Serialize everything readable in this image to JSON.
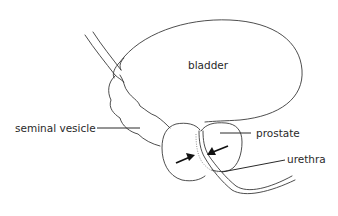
{
  "diagram": {
    "type": "anatomical-illustration",
    "labels": {
      "bladder": "bladder",
      "seminal_vesicle": "seminal vesicle",
      "prostate": "prostate",
      "urethra": "urethra"
    },
    "arrows": {
      "count": 2,
      "meaning": "pointing inward toward urethra through prostate"
    },
    "colors": {
      "line": "#3a3a3a",
      "text": "#2a2a2a",
      "background": "#ffffff"
    }
  }
}
